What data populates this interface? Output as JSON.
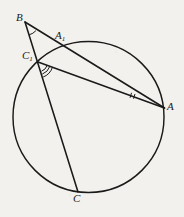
{
  "figure": {
    "type": "euclidean-geometry-diagram",
    "background_color": "#f3f1ee",
    "stroke_color": "#1a1a1a",
    "label_color": "#1a1a1a",
    "width": 184,
    "height": 217,
    "circle": {
      "name": "main-circle",
      "center_x": 88.5,
      "center_y": 117,
      "radius": 75.5,
      "stroke_width": 1.4,
      "fill": "none"
    },
    "points": [
      {
        "id": "B",
        "label": "B",
        "subscript": "",
        "x": 25,
        "y": 22,
        "label_x": 16,
        "label_y": 12,
        "on_circle": false
      },
      {
        "id": "A1",
        "label": "A",
        "subscript": "1",
        "x": 61,
        "y": 47,
        "label_x": 55,
        "label_y": 30,
        "on_circle": true
      },
      {
        "id": "C1",
        "label": "C",
        "subscript": "1",
        "x": 38,
        "y": 62,
        "label_x": 22,
        "label_y": 50,
        "on_circle": true
      },
      {
        "id": "A",
        "label": "A",
        "subscript": "",
        "x": 164.5,
        "y": 108,
        "label_x": 167,
        "label_y": 101,
        "on_circle": true
      },
      {
        "id": "C",
        "label": "C",
        "subscript": "",
        "x": 78,
        "y": 192,
        "label_x": 73,
        "label_y": 193,
        "on_circle": true
      }
    ],
    "segments": [
      {
        "name": "segment-B-A",
        "from": "B",
        "to": "A",
        "stroke_width": 1.5
      },
      {
        "name": "segment-B-C",
        "from": "B",
        "to": "C",
        "stroke_width": 1.5
      },
      {
        "name": "segment-C1-A",
        "from": "C1",
        "to": "A",
        "stroke_width": 1.5
      }
    ],
    "angle_marks": [
      {
        "name": "angle-mark-B",
        "at": "B",
        "arcs": 1,
        "radius": 13,
        "note": "single arc at vertex B between ray BA and ray BC"
      },
      {
        "name": "angle-mark-C1",
        "at": "C1",
        "arcs": 3,
        "radius": 11,
        "note": "triple arc at vertex C1 between segment C1-C and segment C1-A"
      },
      {
        "name": "angle-mark-A",
        "at": "A",
        "arcs": 2,
        "radius": 34,
        "note": "double tick at vertex A between segment A-B and segment A-C1"
      }
    ]
  },
  "labels": {
    "B": {
      "text": "B",
      "sub": ""
    },
    "A1": {
      "text": "A",
      "sub": "1"
    },
    "C1": {
      "text": "C",
      "sub": "1"
    },
    "A": {
      "text": "A",
      "sub": ""
    },
    "C": {
      "text": "C",
      "sub": ""
    }
  }
}
